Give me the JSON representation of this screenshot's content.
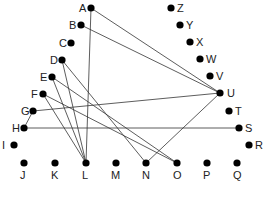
{
  "diagram": {
    "type": "graph",
    "nodes": [
      {
        "id": "A",
        "x": 91,
        "y": 8,
        "lx": -12,
        "ly": 4
      },
      {
        "id": "B",
        "x": 81,
        "y": 25,
        "lx": -12,
        "ly": 4
      },
      {
        "id": "C",
        "x": 71,
        "y": 43,
        "lx": -12,
        "ly": 4
      },
      {
        "id": "D",
        "x": 62,
        "y": 60,
        "lx": -12,
        "ly": 4
      },
      {
        "id": "E",
        "x": 52,
        "y": 77,
        "lx": -12,
        "ly": 4
      },
      {
        "id": "F",
        "x": 43,
        "y": 94,
        "lx": -12,
        "ly": 4
      },
      {
        "id": "G",
        "x": 33,
        "y": 111,
        "lx": -12,
        "ly": 4
      },
      {
        "id": "H",
        "x": 24,
        "y": 128,
        "lx": -12,
        "ly": 4
      },
      {
        "id": "I",
        "x": 14,
        "y": 145,
        "lx": -12,
        "ly": 4
      },
      {
        "id": "J",
        "x": 24,
        "y": 163,
        "lx": -4,
        "ly": 16
      },
      {
        "id": "K",
        "x": 55,
        "y": 163,
        "lx": -4,
        "ly": 16
      },
      {
        "id": "L",
        "x": 86,
        "y": 163,
        "lx": -4,
        "ly": 16
      },
      {
        "id": "M",
        "x": 116,
        "y": 163,
        "lx": -5,
        "ly": 16
      },
      {
        "id": "N",
        "x": 146,
        "y": 163,
        "lx": -4,
        "ly": 16
      },
      {
        "id": "O",
        "x": 177,
        "y": 163,
        "lx": -4,
        "ly": 16
      },
      {
        "id": "P",
        "x": 207,
        "y": 163,
        "lx": -4,
        "ly": 16
      },
      {
        "id": "Q",
        "x": 237,
        "y": 163,
        "lx": -4,
        "ly": 16
      },
      {
        "id": "R",
        "x": 249,
        "y": 145,
        "lx": 6,
        "ly": 4
      },
      {
        "id": "S",
        "x": 239,
        "y": 128,
        "lx": 6,
        "ly": 4
      },
      {
        "id": "T",
        "x": 229,
        "y": 111,
        "lx": 6,
        "ly": 4
      },
      {
        "id": "U",
        "x": 220,
        "y": 93,
        "lx": 7,
        "ly": 4
      },
      {
        "id": "V",
        "x": 210,
        "y": 76,
        "lx": 6,
        "ly": 4
      },
      {
        "id": "W",
        "x": 200,
        "y": 59,
        "lx": 6,
        "ly": 4
      },
      {
        "id": "X",
        "x": 190,
        "y": 42,
        "lx": 6,
        "ly": 4
      },
      {
        "id": "Y",
        "x": 180,
        "y": 25,
        "lx": 6,
        "ly": 4
      },
      {
        "id": "Z",
        "x": 171,
        "y": 8,
        "lx": 6,
        "ly": 4
      }
    ],
    "edges": [
      [
        "A",
        "L"
      ],
      [
        "A",
        "U"
      ],
      [
        "B",
        "U"
      ],
      [
        "D",
        "L"
      ],
      [
        "D",
        "N"
      ],
      [
        "E",
        "L"
      ],
      [
        "E",
        "O"
      ],
      [
        "F",
        "L"
      ],
      [
        "F",
        "O"
      ],
      [
        "G",
        "U"
      ],
      [
        "G",
        "H"
      ],
      [
        "H",
        "S"
      ],
      [
        "N",
        "U"
      ]
    ]
  }
}
